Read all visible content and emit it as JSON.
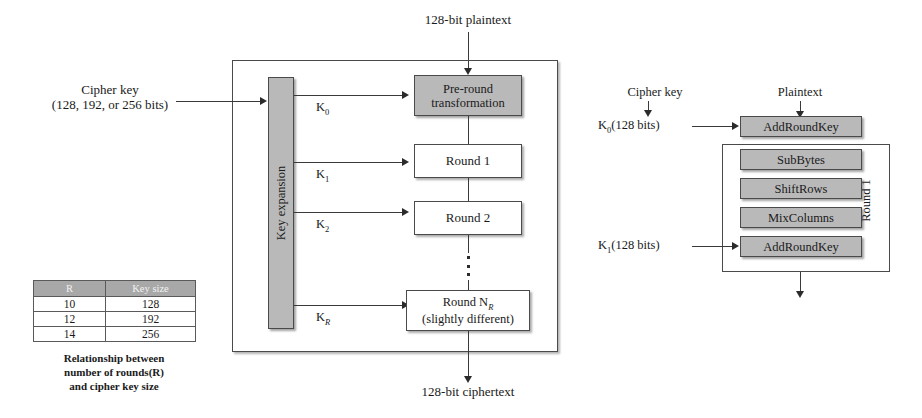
{
  "diagram": {
    "colors": {
      "gray_fill": "#b9b9b9",
      "white_fill": "#ffffff",
      "stroke": "#4a4a4a",
      "table_header": "#a8a8a8"
    }
  },
  "left": {
    "plaintext_label": "128-bit plaintext",
    "ciphertext_label": "128-bit ciphertext",
    "cipher_key_line1": "Cipher key",
    "cipher_key_line2": "(128, 192, or 256 bits)",
    "key_expansion_label": "Key expansion",
    "round_keys": [
      "K0",
      "K1",
      "K2",
      "KR"
    ],
    "boxes": {
      "pre_round_line1": "Pre-round",
      "pre_round_line2": "transformation",
      "round1": "Round 1",
      "round2": "Round 2",
      "roundN_line1": "Round NR",
      "roundN_line2": "(slightly different)"
    },
    "ellipsis": "⋮"
  },
  "table": {
    "headers": [
      "R",
      "Key size"
    ],
    "rows": [
      [
        "10",
        "128"
      ],
      [
        "12",
        "192"
      ],
      [
        "14",
        "256"
      ]
    ],
    "caption_line1": "Relationship between",
    "caption_line2": "number of rounds(R)",
    "caption_line3": "and cipher key size"
  },
  "right": {
    "cipher_key_label": "Cipher key",
    "plaintext_label": "Plaintext",
    "k0_label": "K0(128 bits)",
    "k1_label": "K1(128 bits)",
    "round_label": "Round 1",
    "stages": [
      "AddRoundKey",
      "SubBytes",
      "ShiftRows",
      "MixColumns",
      "AddRoundKey"
    ]
  }
}
